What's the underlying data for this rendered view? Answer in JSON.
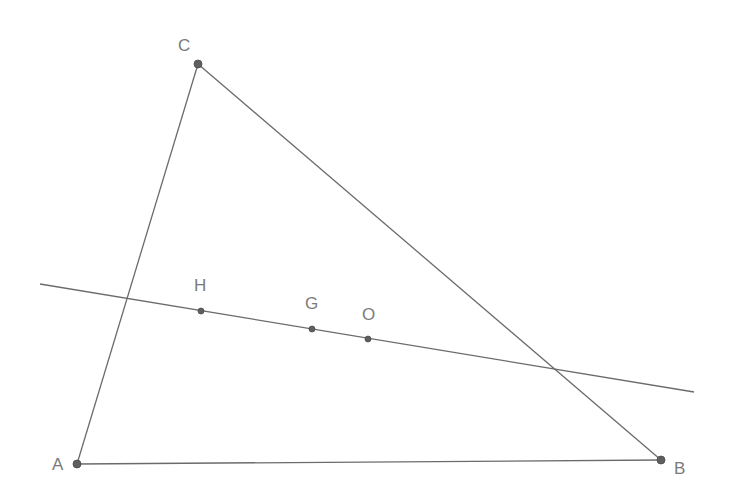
{
  "diagram": {
    "title": "",
    "line_color": "#6b6b6b",
    "point_color": "#5f5f5f",
    "label_color": "#7a7a7a",
    "vertices": [
      {
        "id": "A",
        "label": "A",
        "x": 77,
        "y": 464,
        "lx": 52,
        "ly": 470,
        "r": 4
      },
      {
        "id": "B",
        "label": "B",
        "x": 661,
        "y": 460,
        "lx": 674,
        "ly": 474,
        "r": 4
      },
      {
        "id": "C",
        "label": "C",
        "x": 198,
        "y": 64,
        "lx": 178,
        "ly": 51,
        "r": 4
      }
    ],
    "sides": [
      {
        "from": "A",
        "to": "B"
      },
      {
        "from": "B",
        "to": "C"
      },
      {
        "from": "C",
        "to": "A"
      }
    ],
    "euler_line": {
      "x1": 40,
      "y1": 284,
      "x2": 694,
      "y2": 392
    },
    "line_points": [
      {
        "id": "H",
        "label": "H",
        "x": 201,
        "y": 311,
        "lx": 194,
        "ly": 291,
        "r": 3
      },
      {
        "id": "G",
        "label": "G",
        "x": 312,
        "y": 329,
        "lx": 305,
        "ly": 309,
        "r": 3
      },
      {
        "id": "O",
        "label": "O",
        "x": 368,
        "y": 339,
        "lx": 362,
        "ly": 320,
        "r": 3
      }
    ]
  }
}
